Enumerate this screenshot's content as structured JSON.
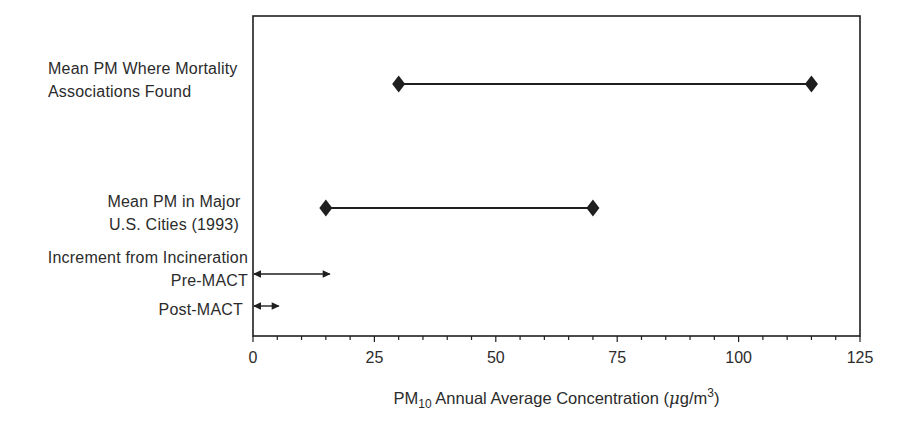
{
  "colors": {
    "ink": "#1f1f1f",
    "text": "#2b2b2b",
    "background": "#ffffff"
  },
  "chart_data": {
    "type": "range",
    "title": "",
    "xlabel": "PM10 Annual Average Concentration (µg/m3)",
    "xlabel_parts": {
      "p1": "PM",
      "sub": "10",
      "p2": " Annual Average Concentration (",
      "mu": "μ",
      "p3": "g/m",
      "sup": "3",
      "p4": ")"
    },
    "xlim": [
      0,
      125
    ],
    "x_major_ticks": [
      0,
      25,
      50,
      75,
      100,
      125
    ],
    "x_minor_tick_step": 5,
    "grid": false,
    "legend": "none",
    "series": [
      {
        "name": "Mean PM Where Mortality Associations Found",
        "label_lines": [
          "Mean PM Where Mortality",
          "Associations Found"
        ],
        "min": 30,
        "max": 115,
        "marker": "diamond-line"
      },
      {
        "name": "Mean PM in Major U.S. Cities (1993)",
        "label_lines": [
          "Mean PM in Major",
          "U.S. Cities (1993)"
        ],
        "min": 15,
        "max": 70,
        "marker": "diamond-line"
      },
      {
        "name": "Increment from Incineration Pre-MACT",
        "label_lines": [
          "Increment from Incineration",
          "Pre-MACT"
        ],
        "min": 0,
        "max": 16,
        "marker": "double-arrow"
      },
      {
        "name": "Post-MACT",
        "label_lines": [
          "Post-MACT"
        ],
        "min": 0,
        "max": 5.5,
        "marker": "double-arrow"
      }
    ]
  }
}
